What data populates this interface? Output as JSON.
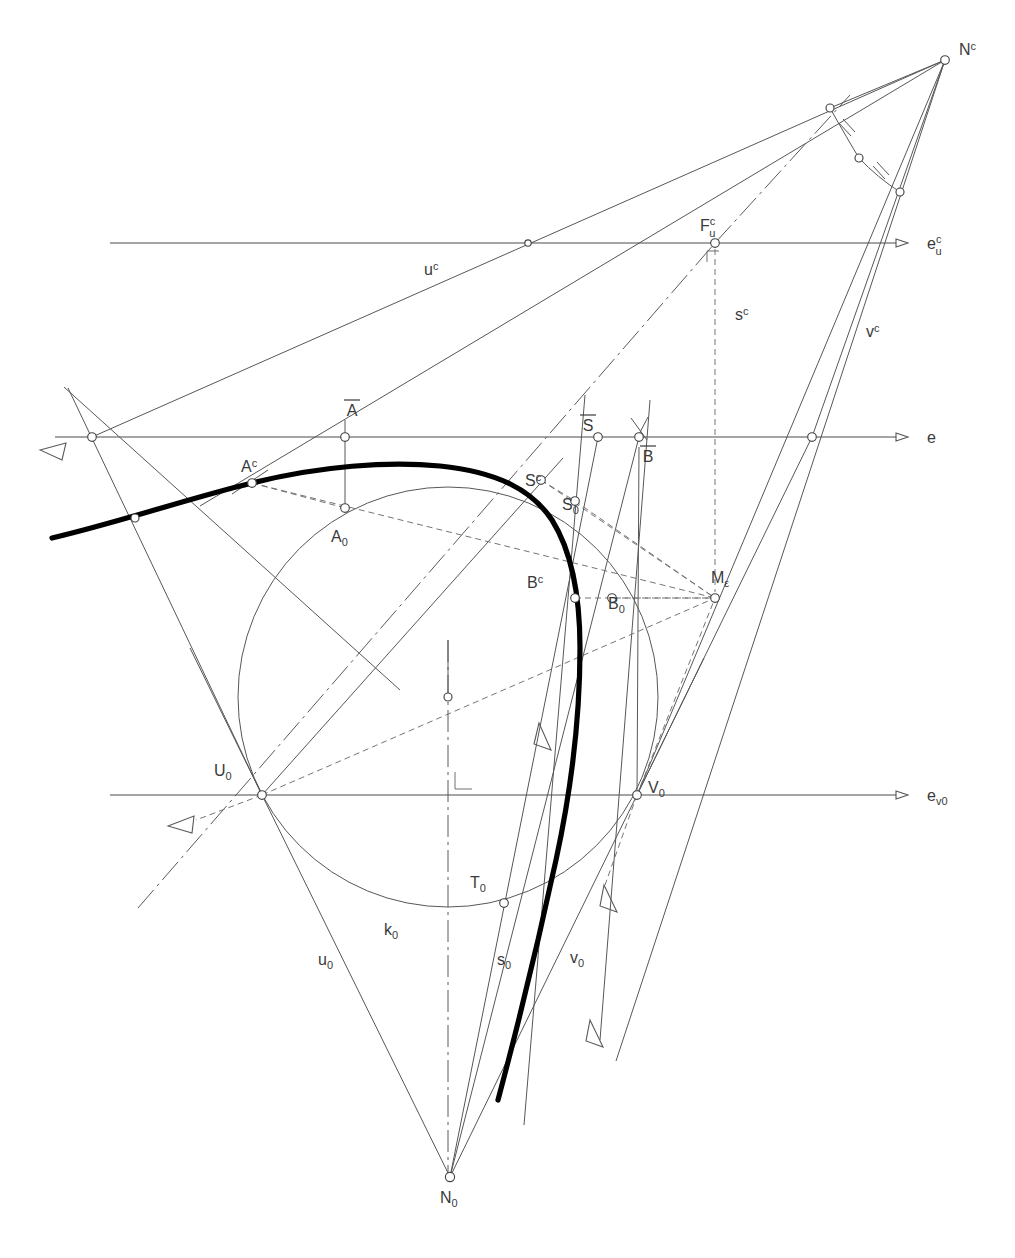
{
  "figure": {
    "domain": "technical-line-drawing",
    "canvas": {
      "width": 1015,
      "height": 1258
    },
    "colors": {
      "thin_line": "#555555",
      "thick_curve": "#000000",
      "axis_line": "#4a4a4a",
      "dashed_line": "#6a6a6a",
      "dashdot_line": "#5a5a5a",
      "label_text": "#3a3a3a",
      "node_fill": "#ffffff",
      "background": "#ffffff"
    }
  },
  "labels": {
    "Nc": {
      "base": "N",
      "sup": "c",
      "sub": "",
      "x": 959,
      "y": 55,
      "anchor": "start"
    },
    "ecu": {
      "base": "e",
      "sup": "c",
      "sub": "u",
      "x": 927,
      "y": 245,
      "anchor": "start"
    },
    "Fuc": {
      "base": "F",
      "sup": "c",
      "sub": "u",
      "x": 700,
      "y": 231,
      "anchor": "start"
    },
    "uc": {
      "base": "u",
      "sup": "c",
      "sub": "",
      "x": 424,
      "y": 275,
      "anchor": "start"
    },
    "sc": {
      "base": "s",
      "sup": "c",
      "sub": "",
      "x": 735,
      "y": 320,
      "anchor": "start"
    },
    "vc": {
      "base": "v",
      "sup": "c",
      "sub": "",
      "x": 866,
      "y": 337,
      "anchor": "start"
    },
    "e": {
      "base": "e",
      "sup": "",
      "sub": "",
      "x": 927,
      "y": 443,
      "anchor": "start"
    },
    "Abar": {
      "base": "A",
      "sup": "",
      "sub": "",
      "x": 352,
      "y": 416,
      "anchor": "middle",
      "overbar": true
    },
    "Sbar": {
      "base": "S",
      "sup": "",
      "sub": "",
      "x": 588,
      "y": 431,
      "anchor": "middle",
      "overbar": true
    },
    "Bbar": {
      "base": "B",
      "sup": "",
      "sub": "",
      "x": 648,
      "y": 462,
      "anchor": "middle",
      "overbar": true
    },
    "Ac": {
      "base": "A",
      "sup": "c",
      "sub": "",
      "x": 241,
      "y": 472,
      "anchor": "start"
    },
    "A0": {
      "base": "A",
      "sup": "",
      "sub": "0",
      "x": 331,
      "y": 542,
      "anchor": "start"
    },
    "Sc": {
      "base": "S",
      "sup": "c",
      "sub": "",
      "x": 525,
      "y": 486,
      "anchor": "start"
    },
    "S0": {
      "base": "S",
      "sup": "",
      "sub": "0",
      "x": 562,
      "y": 510,
      "anchor": "start"
    },
    "Bc": {
      "base": "B",
      "sup": "c",
      "sub": "",
      "x": 527,
      "y": 588,
      "anchor": "start"
    },
    "B0": {
      "base": "B",
      "sup": "",
      "sub": "0",
      "x": 608,
      "y": 609,
      "anchor": "start"
    },
    "Meps": {
      "base": "M",
      "sup": "",
      "sub": "ε",
      "x": 711,
      "y": 583,
      "anchor": "start"
    },
    "U0": {
      "base": "U",
      "sup": "",
      "sub": "0",
      "x": 214,
      "y": 776,
      "anchor": "start"
    },
    "V0": {
      "base": "V",
      "sup": "",
      "sub": "0",
      "x": 648,
      "y": 793,
      "anchor": "start"
    },
    "ev0": {
      "base": "e",
      "sup": "",
      "sub": "v0",
      "x": 927,
      "y": 801,
      "anchor": "start"
    },
    "T0": {
      "base": "T",
      "sup": "",
      "sub": "0",
      "x": 470,
      "y": 888,
      "anchor": "start"
    },
    "k0": {
      "base": "k",
      "sup": "",
      "sub": "0",
      "x": 384,
      "y": 935,
      "anchor": "start"
    },
    "u0": {
      "base": "u",
      "sup": "",
      "sub": "0",
      "x": 318,
      "y": 965,
      "anchor": "start"
    },
    "s0": {
      "base": "s",
      "sup": "",
      "sub": "0",
      "x": 497,
      "y": 965,
      "anchor": "start"
    },
    "v0": {
      "base": "v",
      "sup": "",
      "sub": "0",
      "x": 570,
      "y": 963,
      "anchor": "start"
    },
    "N0": {
      "base": "N",
      "sup": "",
      "sub": "0",
      "x": 440,
      "y": 1203,
      "anchor": "start"
    }
  },
  "points": {
    "Nc": {
      "x": 945,
      "y": 60
    },
    "Fuc": {
      "x": 715,
      "y": 243
    },
    "Meps": {
      "x": 715,
      "y": 598
    },
    "N0": {
      "x": 450,
      "y": 1177
    },
    "U0": {
      "x": 262,
      "y": 795
    },
    "V0": {
      "x": 637,
      "y": 795
    },
    "T0": {
      "x": 504,
      "y": 903
    },
    "A0": {
      "x": 345,
      "y": 508
    },
    "S0": {
      "x": 575,
      "y": 501
    },
    "B0": {
      "x": 612,
      "y": 598
    },
    "Ac": {
      "x": 252,
      "y": 483
    },
    "Sc": {
      "x": 541,
      "y": 480
    },
    "Bc": {
      "x": 575,
      "y": 598
    },
    "Abar": {
      "x": 345,
      "y": 437
    },
    "Sbar": {
      "x": 598,
      "y": 437
    },
    "Bbar": {
      "x": 639,
      "y": 437
    },
    "E_left": {
      "x": 92,
      "y": 437
    },
    "E_right": {
      "x": 812,
      "y": 437
    },
    "ecu_mid": {
      "x": 528,
      "y": 243
    },
    "arc_top": {
      "x": 830,
      "y": 108
    },
    "arc_mid": {
      "x": 859,
      "y": 158
    },
    "arc_bot": {
      "x": 900,
      "y": 192
    },
    "circ_center": {
      "x": 448,
      "y": 697
    },
    "curve_left_node": {
      "x": 135,
      "y": 518
    }
  },
  "axes": [
    {
      "name": "e_u_c",
      "label_key": "ecu",
      "y": 243,
      "x1": 110,
      "x2": 900
    },
    {
      "name": "e",
      "label_key": "e",
      "y": 437,
      "x1": 55,
      "x2": 900
    },
    {
      "name": "e_v0",
      "label_key": "ev0",
      "y": 795,
      "x1": 110,
      "x2": 900
    }
  ],
  "circle_k0": {
    "cx": 448,
    "cy": 697,
    "r": 210
  },
  "annotations": {
    "right_angle_markers": [
      {
        "name": "right-angle-at-Fuc",
        "x": 715,
        "y": 243
      },
      {
        "name": "right-angle-at-axis",
        "x": 455,
        "y": 790
      }
    ],
    "tick_marks_on_angle_bisector_arc": 2,
    "arrow_heads": [
      {
        "name": "arrow-ecu",
        "x": 900,
        "y": 243,
        "dir": "right"
      },
      {
        "name": "arrow-e",
        "x": 900,
        "y": 437,
        "dir": "right"
      },
      {
        "name": "arrow-ev0",
        "x": 900,
        "y": 795,
        "dir": "right"
      },
      {
        "name": "arrow-upper-left",
        "x": 52,
        "y": 455,
        "dir": "left-down"
      },
      {
        "name": "arrow-lower-left",
        "x": 178,
        "y": 826,
        "dir": "left-down"
      },
      {
        "name": "arrow-s0-mid",
        "x": 548,
        "y": 737,
        "dir": "down-right"
      },
      {
        "name": "arrow-v0-mid",
        "x": 615,
        "y": 898,
        "dir": "down-right"
      },
      {
        "name": "arrow-v0-bottom",
        "x": 601,
        "y": 1033,
        "dir": "down-right"
      }
    ]
  }
}
